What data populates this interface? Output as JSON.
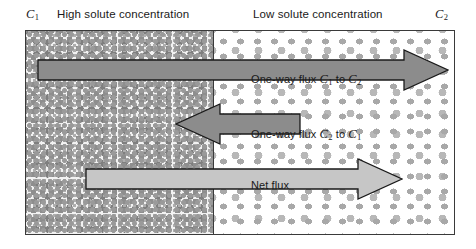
{
  "figure": {
    "name": "solute-diffusion-flux-diagram",
    "header": {
      "c1_symbol": "C",
      "c1_subscript": "1",
      "left_label": "High solute concentration",
      "right_label": "Low solute concentration",
      "c2_symbol": "C",
      "c2_subscript": "2"
    },
    "arrows": [
      {
        "id": "one-way-flux-forward",
        "direction": "right",
        "caption_prefix": "One-way flux ",
        "caption_from": "C",
        "caption_from_sub": "1",
        "caption_mid": " to ",
        "caption_to": "C",
        "caption_to_sub": "2",
        "fill": "#8c8c8c",
        "stroke": "#1a1a1a"
      },
      {
        "id": "one-way-flux-backward",
        "direction": "left",
        "caption_prefix": "One-way flux ",
        "caption_from": "C",
        "caption_from_sub": "2",
        "caption_mid": " to ",
        "caption_to": "C",
        "caption_to_sub": "1",
        "fill": "#8c8c8c",
        "stroke": "#1a1a1a"
      },
      {
        "id": "net-flux",
        "direction": "right",
        "caption_prefix": "Net flux",
        "fill": "#c6c6c6",
        "stroke": "#1a1a1a"
      }
    ],
    "regions": {
      "left_region_name": "high-concentration-region",
      "right_region_name": "low-concentration-region"
    },
    "colors": {
      "border": "#3a3a3a",
      "left_fill": "#f2f2f2",
      "right_fill": "#ffffff",
      "dark_arrow": "#8c8c8c",
      "light_arrow": "#c6c6c6",
      "text": "#1a1a1a"
    }
  }
}
